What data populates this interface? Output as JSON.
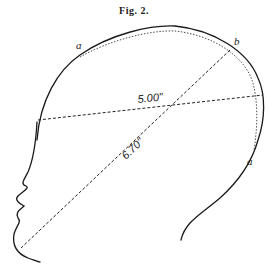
{
  "figure": {
    "title": "Fig. 2.",
    "labels": {
      "point_a_top": "a",
      "point_b": "b",
      "point_a_right": "a"
    },
    "measurements": {
      "horizontal": "5.00\"",
      "diagonal": "6.70\""
    }
  }
}
